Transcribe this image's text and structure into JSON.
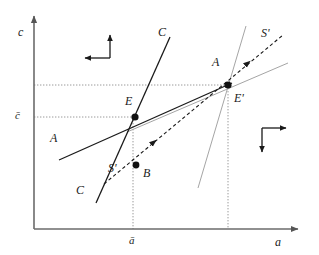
{
  "figure": {
    "kind": "phase-diagram",
    "background": "#ffffff",
    "width": 319,
    "height": 255
  },
  "axes": {
    "y_label": "c",
    "x_label": "a",
    "color": "#555555",
    "origin": {
      "x": 34,
      "y": 229
    },
    "y_top": 14,
    "x_right": 300
  },
  "ticks": {
    "y": {
      "label": "c̄",
      "value_y": 117
    },
    "x": {
      "label": "ā",
      "value_x": 133
    }
  },
  "guides": {
    "color": "#9a9a9a",
    "horizontal": [
      {
        "name": "c-prime-level",
        "y": 85,
        "x_from": 34,
        "x_to": 228
      },
      {
        "name": "c-bar-level",
        "y": 117,
        "x_from": 34,
        "x_to": 135
      }
    ],
    "vertical": [
      {
        "name": "a-bar-line",
        "x": 133,
        "y_from": 117,
        "y_to": 229
      },
      {
        "name": "a-prime-line",
        "x": 228,
        "y_from": 85,
        "y_to": 229
      }
    ]
  },
  "points": [
    {
      "name": "E",
      "label": "E",
      "x": 135,
      "y": 117,
      "label_x": 125,
      "label_y": 95
    },
    {
      "name": "Eprime",
      "label": "E'",
      "x": 228,
      "y": 85,
      "label_x": 234,
      "label_y": 92
    },
    {
      "name": "B",
      "label": "B",
      "x": 136,
      "y": 165,
      "label_x": 143,
      "label_y": 167
    }
  ],
  "curve_labels": [
    {
      "name": "C-upper",
      "text": "C",
      "x": 158,
      "y": 26
    },
    {
      "name": "C-lower",
      "text": "C",
      "x": 76,
      "y": 184
    },
    {
      "name": "A-upper",
      "text": "A",
      "x": 212,
      "y": 56
    },
    {
      "name": "A-lower",
      "text": "A",
      "x": 50,
      "y": 132
    },
    {
      "name": "Sprime-upper",
      "text": "S'",
      "x": 261,
      "y": 27
    },
    {
      "name": "Sprime-lower",
      "text": "S'",
      "x": 108,
      "y": 162
    }
  ],
  "curves": [
    {
      "name": "C-schedule",
      "style": "solid",
      "color": "#1a1a1a",
      "x1": 170,
      "y1": 37,
      "x2": 96,
      "y2": 203
    },
    {
      "name": "A-schedule",
      "style": "solid",
      "color": "#1a1a1a",
      "x1": 59,
      "y1": 160,
      "x2": 232,
      "y2": 83
    },
    {
      "name": "S-saddle-path",
      "style": "dashed",
      "color": "#1a1a1a",
      "x1": 104,
      "y1": 184,
      "x2": 283,
      "y2": 35
    },
    {
      "name": "C-new-schedule",
      "style": "solid",
      "color": "#9a9a9a",
      "x1": 246,
      "y1": 26,
      "x2": 198,
      "y2": 188
    },
    {
      "name": "A-new-schedule",
      "style": "solid",
      "color": "#9a9a9a",
      "x1": 127,
      "y1": 132,
      "x2": 288,
      "y2": 63
    }
  ],
  "direction_fields": [
    {
      "name": "upper-left-direction-field",
      "corner_x": 110,
      "corner_y": 58,
      "up_to_y": 34,
      "left_to_x": 84
    },
    {
      "name": "lower-right-direction-field",
      "corner_x": 262,
      "corner_y": 128,
      "down_to_y": 153,
      "right_to_x": 287
    }
  ],
  "arrows_on_path": [
    {
      "name": "saddle-arrow-lower",
      "x": 150,
      "y": 145
    },
    {
      "name": "saddle-arrow-upper",
      "x": 244,
      "y": 66
    }
  ]
}
